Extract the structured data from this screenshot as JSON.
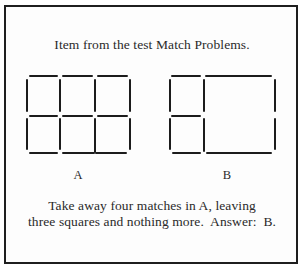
{
  "title": "Item from the test Match Problems.",
  "figures": {
    "a": {
      "label": "A",
      "description": "3x2 grid of six squares made of 17 matches"
    },
    "b": {
      "label": "B",
      "description": "Three squares: two small stacked on the left, one large on the right"
    }
  },
  "description": {
    "line1": "Take away four matches in A, leaving",
    "line2": "three squares and nothing more.  Answer:  B."
  },
  "colors": {
    "match": "#1c1c1c",
    "border": "#1e1e1e",
    "text": "#2a2a2a",
    "background": "#fdfdfd"
  }
}
